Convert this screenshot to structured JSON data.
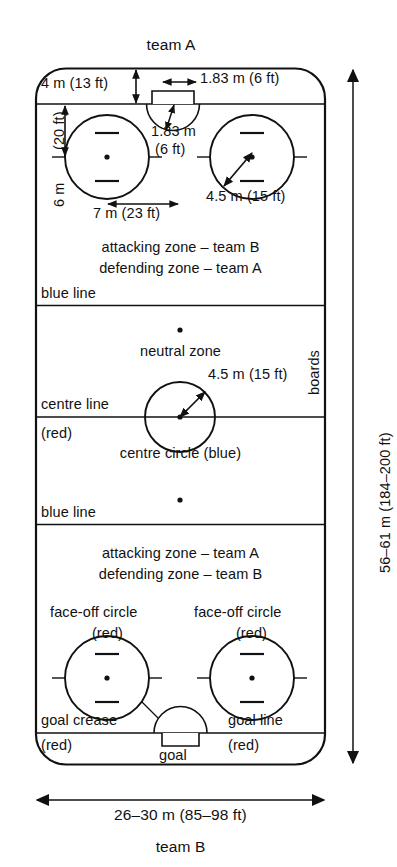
{
  "figure": {
    "title_top": "team A",
    "title_bottom": "team B",
    "type": "ice-hockey-rink-diagram"
  },
  "labels": {
    "team_a": "team A",
    "team_b": "team B",
    "goal_line_to_boards": "4 m (13 ft)",
    "goal_width": "1.83 m (6 ft)",
    "crease_radius": "1.83 m",
    "crease_radius_unit": "(6 ft)",
    "faceoff_to_goal_line": "6 m",
    "faceoff_to_goal_line_ft": "(20 ft)",
    "faceoff_spacing": "7 m (23 ft)",
    "faceoff_radius_top": "4.5 m (15 ft)",
    "centre_circle_radius": "4.5 m (15 ft)",
    "zone_top_attacking": "attacking zone – team B",
    "zone_top_defending": "defending zone – team A",
    "zone_bottom_attacking": "attacking zone – team A",
    "zone_bottom_defending": "defending zone – team B",
    "blue_line_top": "blue line",
    "blue_line_bottom": "blue line",
    "neutral_zone": "neutral zone",
    "centre_line": "centre line",
    "centre_line_colour": "(red)",
    "centre_circle": "centre circle (blue)",
    "boards": "boards",
    "rink_length": "56–61 m (184–200 ft)",
    "rink_width": "26–30 m (85–98 ft)",
    "faceoff_circle_left": "face-off circle",
    "faceoff_circle_left_colour": "(red)",
    "faceoff_circle_right": "face-off circle",
    "faceoff_circle_right_colour": "(red)",
    "goal_crease": "goal crease",
    "goal_crease_colour": "(red)",
    "goal_line": "goal line",
    "goal_line_colour": "(red)",
    "goal": "goal"
  },
  "dimensions": {
    "rink_length_m": "56–61",
    "rink_length_ft": "184–200",
    "rink_width_m": "26–30",
    "rink_width_ft": "85–98",
    "goal_line_distance_m": 4,
    "goal_line_distance_ft": 13,
    "goal_width_m": 1.83,
    "goal_width_ft": 6,
    "crease_radius_m": 1.83,
    "crease_radius_ft": 6,
    "faceoff_circle_radius_m": 4.5,
    "faceoff_circle_radius_ft": 15,
    "faceoff_to_goal_line_m": 6,
    "faceoff_to_goal_line_ft": 20,
    "faceoff_spacing_m": 7,
    "faceoff_spacing_ft": 23
  },
  "colors": {
    "line": "#111111",
    "background": "#ffffff",
    "blue_line": "#111111",
    "red_line": "#111111"
  }
}
